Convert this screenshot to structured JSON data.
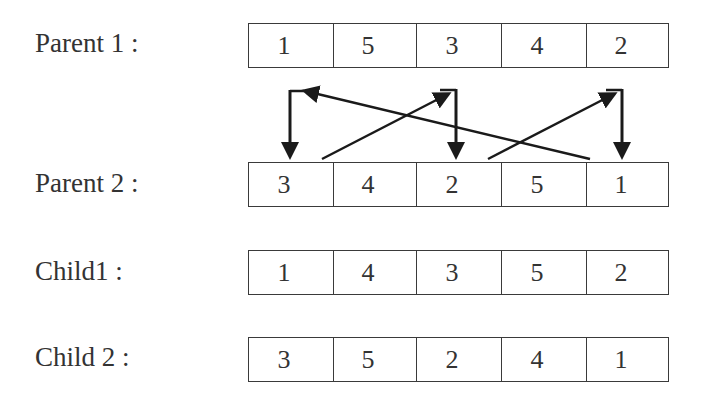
{
  "diagram": {
    "title": "",
    "type": "crossover-illustration",
    "rows": [
      {
        "label": "Parent 1 :",
        "values": [
          "1",
          "5",
          "3",
          "4",
          "2"
        ]
      },
      {
        "label": "Parent 2 :",
        "values": [
          "3",
          "4",
          "2",
          "5",
          "1"
        ]
      },
      {
        "label": "Child1 :",
        "values": [
          "1",
          "4",
          "3",
          "5",
          "2"
        ]
      },
      {
        "label": "Child 2 :",
        "values": [
          "3",
          "5",
          "2",
          "4",
          "1"
        ]
      }
    ],
    "arrows": [
      {
        "from": "parent2-cell-5-top",
        "to": "corner-above-cell-1",
        "then_down_to": "parent2-cell-1"
      },
      {
        "from": "parent2-cell-1-top",
        "to": "corner-above-cell-3",
        "then_down_to": "parent2-cell-3"
      },
      {
        "from": "parent2-cell-3-top",
        "to": "corner-above-cell-5",
        "then_down_to": "parent2-cell-5"
      }
    ],
    "colors": {
      "line": "#1a1a1a",
      "border": "#3a3a3a",
      "text": "#333333",
      "background": "#ffffff"
    }
  }
}
